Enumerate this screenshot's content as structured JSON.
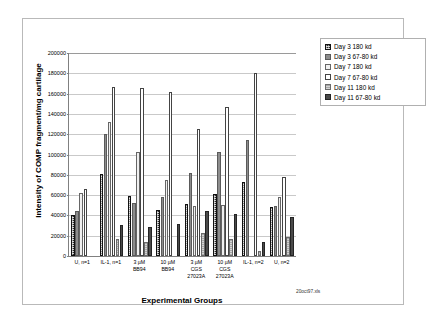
{
  "chart_data": {
    "type": "bar",
    "title": "",
    "xlabel": "Experimental Groups",
    "ylabel": "Intensity of COMP fragment/mg cartilage",
    "ylim": [
      0,
      200000
    ],
    "ytick_values": [
      0,
      20000,
      40000,
      60000,
      80000,
      100000,
      120000,
      140000,
      160000,
      180000,
      200000
    ],
    "ytick_labels": [
      "0",
      "20000",
      "40000",
      "60000",
      "80000",
      "100000",
      "120000",
      "140000",
      "160000",
      "180000",
      "200000"
    ],
    "grid": true,
    "legend_position": "right",
    "categories": [
      "U, n=1",
      "IL-1, n=1",
      "3 µM\nBB94",
      "10 µM\nBB94",
      "3 µM\nCGS\n27023A",
      "10 µM\nCGS\n27023A",
      "IL-1, n=2",
      "U, n=2"
    ],
    "series": [
      {
        "name": "Day 3 180 kd",
        "values": [
          40500,
          80500,
          59500,
          45000,
          51000,
          61000,
          73000,
          48500
        ]
      },
      {
        "name": "Day 3 67-80 kd",
        "values": [
          44500,
          120500,
          52500,
          58000,
          81500,
          102500,
          114500,
          49000
        ]
      },
      {
        "name": "Day 7 180 kd",
        "values": [
          62000,
          132000,
          102500,
          75000,
          49000,
          50000,
          0,
          58500
        ]
      },
      {
        "name": "Day 7 67-80 kd",
        "values": [
          66500,
          166500,
          165500,
          162000,
          125000,
          147000,
          180000,
          78000
        ]
      },
      {
        "name": "Day 11 180 kd",
        "values": [
          0,
          16500,
          14000,
          0,
          22500,
          17000,
          4500,
          19000
        ]
      },
      {
        "name": "Day 11 67-80 kd",
        "values": [
          0,
          30500,
          28500,
          32000,
          44000,
          41500,
          14000,
          38500
        ]
      }
    ]
  },
  "legend": {
    "items": [
      {
        "label": "Day 3 180 kd",
        "swatch": "series-0-swatch"
      },
      {
        "label": "Day 3 67-80 kd",
        "swatch": "series-1-swatch"
      },
      {
        "label": "Day 7 180 kd",
        "swatch": "series-2-swatch"
      },
      {
        "label": "Day 7 67-80 kd",
        "swatch": "series-3-swatch"
      },
      {
        "label": "Day 11 180 kd",
        "swatch": "series-4-swatch"
      },
      {
        "label": "Day 11 67-80 kd",
        "swatch": "series-5-swatch"
      }
    ]
  },
  "footnote": "20oct97.xls",
  "colors": {
    "axis": "#808080",
    "grid": "#c9c9c9",
    "frame": "#b9b9b9",
    "text": "#000000"
  }
}
